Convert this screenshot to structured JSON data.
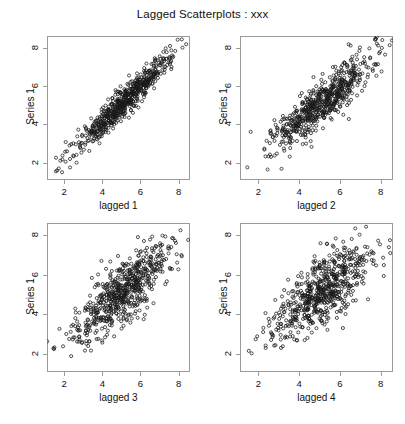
{
  "figure": {
    "title": "Lagged Scatterplots : xxx",
    "caption": "",
    "point_style": "open-circle",
    "point_color": "#1a1a1a",
    "frame_color": "#9a9a9a",
    "background": "#ffffff"
  },
  "axis": {
    "ticks": [
      2,
      4,
      6,
      8
    ],
    "tick_labels": [
      "2",
      "4",
      "6",
      "8"
    ],
    "xlim": [
      1.1,
      8.6
    ],
    "ylim": [
      1.1,
      8.6
    ]
  },
  "chart_data": {
    "type": "scatter",
    "title": "Lagged Scatterplots : xxx",
    "layout": "2x2 grid of lagged scatterplots",
    "grid": false,
    "legend": "none",
    "shared_ylabel": "Series 1",
    "xlim": [
      1.1,
      8.6
    ],
    "ylim": [
      1.1,
      8.6
    ],
    "xticks": [
      2,
      4,
      6,
      8
    ],
    "yticks": [
      2,
      4,
      6,
      8
    ],
    "n_points_per_panel": 650,
    "panels": [
      {
        "id": "panel-lag-1",
        "xlabel": "lagged 1",
        "ylabel": "Series 1",
        "lag": 1,
        "correlation": 0.95,
        "x_mean": 5.15,
        "y_mean": 5.15,
        "x_sd": 1.25,
        "y_sd": 1.25
      },
      {
        "id": "panel-lag-2",
        "xlabel": "lagged 2",
        "ylabel": "Series 1",
        "lag": 2,
        "correlation": 0.88,
        "x_mean": 5.15,
        "y_mean": 5.15,
        "x_sd": 1.25,
        "y_sd": 1.25
      },
      {
        "id": "panel-lag-3",
        "xlabel": "lagged 3",
        "ylabel": "Series 1",
        "lag": 3,
        "correlation": 0.8,
        "x_mean": 5.15,
        "y_mean": 5.15,
        "x_sd": 1.25,
        "y_sd": 1.25
      },
      {
        "id": "panel-lag-4",
        "xlabel": "lagged 4",
        "ylabel": "Series 1",
        "lag": 4,
        "correlation": 0.72,
        "x_mean": 5.15,
        "y_mean": 5.15,
        "x_sd": 1.25,
        "y_sd": 1.25
      }
    ]
  }
}
